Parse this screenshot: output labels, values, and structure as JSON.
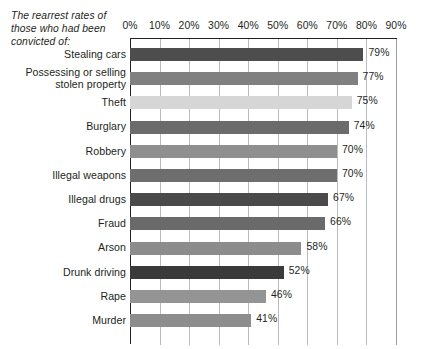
{
  "caption": "The rearrest rates\nof those who had\nbeen convicted of:",
  "chart_data": {
    "type": "bar",
    "orientation": "horizontal",
    "title": "The rearrest rates of those who had been convicted of:",
    "xlabel": "",
    "ylabel": "",
    "xlim": [
      0,
      90
    ],
    "grid": true,
    "legend": "none",
    "value_suffix": "%",
    "tick_labels": [
      "0%",
      "10%",
      "20%",
      "30%",
      "40%",
      "50%",
      "60%",
      "70%",
      "80%",
      "90%"
    ],
    "tick_values": [
      0,
      10,
      20,
      30,
      40,
      50,
      60,
      70,
      80,
      90
    ],
    "categories": [
      "Stealing cars",
      "Possessing or selling\nstolen property",
      "Theft",
      "Burglary",
      "Robbery",
      "Illegal weapons",
      "Illegal drugs",
      "Fraud",
      "Arson",
      "Drunk driving",
      "Rape",
      "Murder"
    ],
    "values": [
      79,
      77,
      75,
      74,
      70,
      70,
      67,
      66,
      58,
      52,
      46,
      41
    ],
    "value_labels": [
      "79%",
      "77%",
      "75%",
      "74%",
      "70%",
      "70%",
      "67%",
      "66%",
      "58%",
      "52%",
      "46%",
      "41%"
    ],
    "bar_colors": [
      "#4d4d4d",
      "#808080",
      "#d6d6d6",
      "#6b6b6b",
      "#8f8f8f",
      "#6e6e6e",
      "#4a4a4a",
      "#6a6a6a",
      "#8c8c8c",
      "#3a3a3a",
      "#949494",
      "#8d8d8d"
    ]
  },
  "colors": {
    "axis": "#231f20",
    "gridline": "#b8bcc0",
    "text": "#231f20",
    "background": "#ffffff"
  }
}
